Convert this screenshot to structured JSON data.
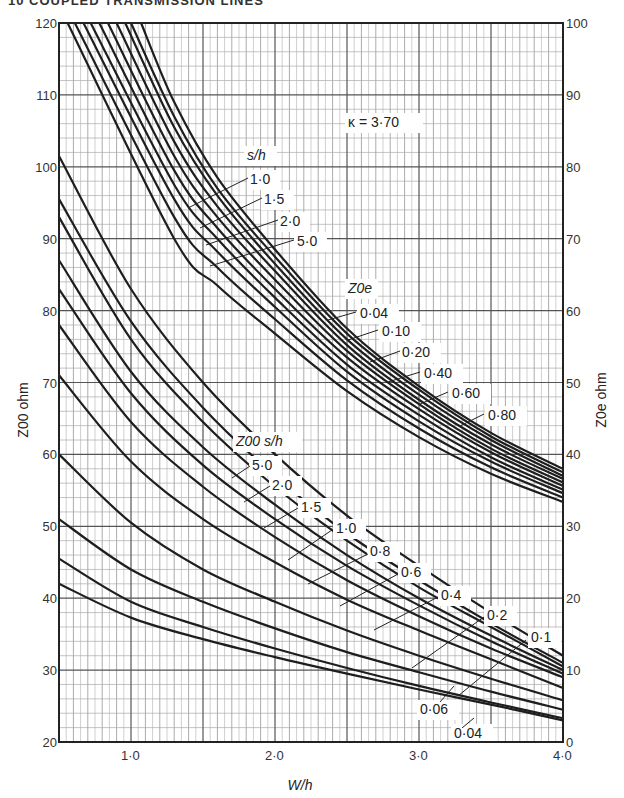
{
  "header": {
    "text": "10  COUPLED TRANSMISSION LINES"
  },
  "chart_data": {
    "type": "line",
    "title": "",
    "annotation_kappa": "κ = 3·70",
    "xlabel": "W/h",
    "ylabel_left": "Z00 ohm",
    "ylabel_right": "Z0e ohm",
    "xlim": [
      0.5,
      4.0
    ],
    "ylim_left": [
      20,
      120
    ],
    "ylim_right": [
      0,
      100
    ],
    "grid": true,
    "x_ticks": [
      {
        "value": 1.0,
        "label": "1·0"
      },
      {
        "value": 2.0,
        "label": "2·0"
      },
      {
        "value": 3.0,
        "label": "3·0"
      },
      {
        "value": 4.0,
        "label": "4·0"
      }
    ],
    "y_ticks_left": [
      {
        "value": 120,
        "label": "120"
      },
      {
        "value": 110,
        "label": "110"
      },
      {
        "value": 100,
        "label": "100"
      },
      {
        "value": 90,
        "label": "90"
      },
      {
        "value": 80,
        "label": "80"
      },
      {
        "value": 70,
        "label": "70"
      },
      {
        "value": 60,
        "label": "60"
      },
      {
        "value": 50,
        "label": "50"
      },
      {
        "value": 40,
        "label": "40"
      },
      {
        "value": 30,
        "label": "30"
      },
      {
        "value": 20,
        "label": "20"
      }
    ],
    "y_ticks_right": [
      {
        "value": 100,
        "label": "100"
      },
      {
        "value": 90,
        "label": "90"
      },
      {
        "value": 80,
        "label": "80"
      },
      {
        "value": 70,
        "label": "70"
      },
      {
        "value": 60,
        "label": "60"
      },
      {
        "value": 50,
        "label": "50"
      },
      {
        "value": 40,
        "label": "40"
      },
      {
        "value": 30,
        "label": "30"
      },
      {
        "value": 20,
        "label": "20"
      },
      {
        "value": 10,
        "label": "10"
      },
      {
        "value": 0,
        "label": "0"
      }
    ],
    "zoe_family": {
      "axis": "right",
      "legend_title_sh": "s/h",
      "sh_labels": [
        "1·0",
        "1·5",
        "2·0",
        "5·0"
      ],
      "legend_title_zoe": "Z0e",
      "zoe_labels": [
        "0·04",
        "0·10",
        "0·20",
        "0·40",
        "0·60",
        "0·80"
      ],
      "series": [
        {
          "name": "Zoe-1",
          "x": [
            1.07,
            1.3,
            1.6,
            2.0,
            2.5,
            3.0,
            3.5,
            4.0
          ],
          "y": [
            100,
            89,
            78.5,
            68.5,
            57.5,
            49.5,
            43,
            38
          ]
        },
        {
          "name": "Zoe-2",
          "x": [
            1.0,
            1.3,
            1.6,
            2.0,
            2.5,
            3.0,
            3.5,
            4.0
          ],
          "y": [
            100,
            87,
            77,
            67.5,
            56.8,
            49,
            42.5,
            37.5
          ]
        },
        {
          "name": "Zoe-3",
          "x": [
            0.96,
            1.3,
            1.6,
            2.0,
            2.5,
            3.0,
            3.5,
            4.0
          ],
          "y": [
            100,
            85.5,
            76,
            66.5,
            56,
            48.3,
            42,
            37
          ]
        },
        {
          "name": "Zoe-4",
          "x": [
            0.9,
            1.3,
            1.6,
            2.0,
            2.5,
            3.0,
            3.5,
            4.0
          ],
          "y": [
            100,
            83.5,
            74.5,
            65.5,
            55.2,
            47.6,
            41.4,
            36.6
          ]
        },
        {
          "name": "Zoe-5",
          "x": [
            0.84,
            1.3,
            1.6,
            2.0,
            2.5,
            3.0,
            3.5,
            4.0
          ],
          "y": [
            100,
            81.5,
            73,
            64.3,
            54.4,
            47,
            40.8,
            36.1
          ]
        },
        {
          "name": "Zoe-6",
          "x": [
            0.78,
            1.3,
            1.6,
            2.0,
            2.5,
            3.0,
            3.5,
            4.0
          ],
          "y": [
            100,
            79.5,
            71.5,
            63,
            53.5,
            46.3,
            40.3,
            35.6
          ]
        },
        {
          "name": "Zoe-7",
          "x": [
            0.72,
            1.3,
            1.6,
            2.0,
            2.5,
            3.0,
            3.5,
            4.0
          ],
          "y": [
            100,
            77.5,
            70,
            61.8,
            52.5,
            45.5,
            39.6,
            35.1
          ]
        },
        {
          "name": "Zoe-8",
          "x": [
            0.67,
            1.3,
            1.6,
            2.0,
            2.5,
            3.0,
            3.5,
            4.0
          ],
          "y": [
            100,
            75.5,
            68.2,
            60.5,
            51.5,
            44.6,
            39,
            34.6
          ]
        },
        {
          "name": "Zoe-9",
          "x": [
            0.61,
            1.3,
            1.6,
            2.0,
            2.5,
            3.0,
            3.5,
            4.0
          ],
          "y": [
            100,
            73,
            66,
            58.8,
            50.3,
            43.6,
            38.2,
            34
          ]
        },
        {
          "name": "Zoe-10",
          "x": [
            0.56,
            1.3,
            1.6,
            2.0,
            2.5,
            3.0,
            3.5,
            4.0
          ],
          "y": [
            100,
            70,
            63.5,
            56.8,
            48.8,
            42.4,
            37.3,
            33.4
          ]
        }
      ]
    },
    "zoo_family": {
      "axis": "left",
      "legend_title": "Z00 s/h",
      "sh_labels": [
        "5·0",
        "2·0",
        "1·5",
        "1·0",
        "0·8",
        "0·6",
        "0·4",
        "0·2",
        "0·1",
        "0·06",
        "0·04"
      ],
      "series": [
        {
          "name": "Zoo-1",
          "x": [
            0.5,
            1.0,
            1.5,
            2.0,
            2.5,
            3.0,
            3.5,
            4.0
          ],
          "y": [
            101.5,
            83,
            70,
            60,
            51.5,
            44.5,
            38,
            32
          ]
        },
        {
          "name": "Zoo-2",
          "x": [
            0.5,
            1.0,
            1.5,
            2.0,
            2.5,
            3.0,
            3.5,
            4.0
          ],
          "y": [
            95.5,
            78.5,
            66.5,
            57,
            49,
            42.5,
            36.5,
            31
          ]
        },
        {
          "name": "Zoo-3",
          "x": [
            0.5,
            1.0,
            1.5,
            2.0,
            2.5,
            3.0,
            3.5,
            4.0
          ],
          "y": [
            93,
            76,
            64.5,
            55.5,
            48,
            41.5,
            36,
            30.5
          ]
        },
        {
          "name": "Zoo-4",
          "x": [
            0.5,
            1.0,
            1.5,
            2.0,
            2.5,
            3.0,
            3.5,
            4.0
          ],
          "y": [
            87,
            71.5,
            61,
            53,
            46,
            40,
            34.8,
            30
          ]
        },
        {
          "name": "Zoo-5",
          "x": [
            0.5,
            1.0,
            1.5,
            2.0,
            2.5,
            3.0,
            3.5,
            4.0
          ],
          "y": [
            83,
            68.5,
            58.5,
            51,
            44.5,
            39,
            34,
            29.5
          ]
        },
        {
          "name": "Zoo-6",
          "x": [
            0.5,
            1.0,
            1.5,
            2.0,
            2.5,
            3.0,
            3.5,
            4.0
          ],
          "y": [
            78,
            64.5,
            55.5,
            48.5,
            42.5,
            37.5,
            33,
            29
          ]
        },
        {
          "name": "Zoo-7",
          "x": [
            0.5,
            1.0,
            1.5,
            2.0,
            2.5,
            3.0,
            3.5,
            4.0
          ],
          "y": [
            71,
            59,
            51,
            45,
            39.8,
            35.5,
            31.5,
            27.5
          ]
        },
        {
          "name": "Zoo-8",
          "x": [
            0.5,
            1.0,
            1.5,
            2.0,
            2.5,
            3.0,
            3.5,
            4.0
          ],
          "y": [
            60,
            50.5,
            44,
            39.5,
            35.5,
            32,
            28.8,
            25.8
          ]
        },
        {
          "name": "Zoo-9",
          "x": [
            0.5,
            1.0,
            1.5,
            2.0,
            2.5,
            3.0,
            3.5,
            4.0
          ],
          "y": [
            51,
            44,
            39.5,
            35.8,
            32.5,
            29.7,
            27,
            24.5
          ]
        },
        {
          "name": "Zoo-10",
          "x": [
            0.5,
            1.0,
            1.5,
            2.0,
            2.5,
            3.0,
            3.5,
            4.0
          ],
          "y": [
            45.5,
            39.5,
            36,
            33,
            30.3,
            27.8,
            25.5,
            23.3
          ]
        },
        {
          "name": "Zoo-11",
          "x": [
            0.5,
            1.0,
            1.5,
            2.0,
            2.5,
            3.0,
            3.5,
            4.0
          ],
          "y": [
            42,
            37.3,
            34.3,
            31.8,
            29.5,
            27.3,
            25.2,
            23
          ]
        }
      ]
    }
  }
}
